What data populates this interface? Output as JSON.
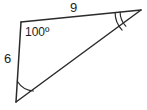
{
  "figure": {
    "type": "triangle-diagram",
    "stroke_color": "#2b2b2b",
    "text_color": "#1d1d1d",
    "background_color": "#ffffff",
    "vertices": {
      "top_left": {
        "x": 21,
        "y": 22
      },
      "right": {
        "x": 141,
        "y": 10
      },
      "bottom_left": {
        "x": 16,
        "y": 102
      }
    },
    "labels": {
      "side_top": "9",
      "side_left": "6",
      "angle_top_left": "100º"
    },
    "angle_marks": {
      "bottom_left_arcs": 1,
      "right_arcs": 2,
      "top_left_arcs": 0
    }
  }
}
